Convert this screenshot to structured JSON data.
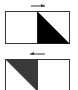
{
  "diagram": {
    "panels": [
      {
        "id": "top",
        "arrow_direction": "right",
        "filled_half": "right",
        "triangle": "top-left to bottom-right, lower-left filled",
        "fill_color": "#000000"
      },
      {
        "id": "bottom",
        "arrow_direction": "left",
        "filled_half": "left",
        "triangle": "top-left to bottom-right, upper-right filled",
        "fill_color": "#3a3a3a"
      }
    ],
    "stroke_color": "#333333",
    "background": "#ffffff"
  }
}
